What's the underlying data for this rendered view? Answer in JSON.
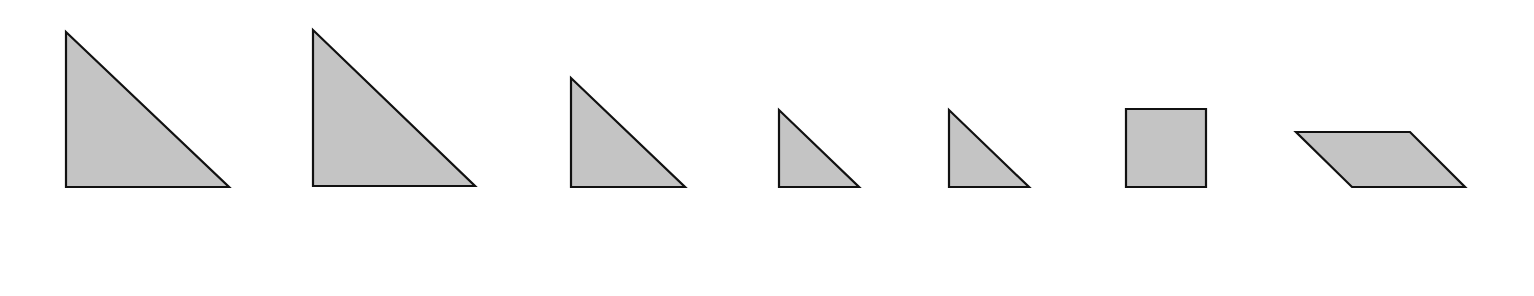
{
  "diagram": {
    "fill_color": "#c4c4c4",
    "stroke_color": "#111111",
    "stroke_width": 2.2,
    "shapes": [
      {
        "name": "large-triangle-1",
        "type": "triangle",
        "points": "66,32 66,187 229,187"
      },
      {
        "name": "large-triangle-2",
        "type": "triangle",
        "points": "313,30 313,186 475,186"
      },
      {
        "name": "medium-triangle",
        "type": "triangle",
        "points": "571,78 571,187 685,187"
      },
      {
        "name": "small-triangle-1",
        "type": "triangle",
        "points": "779,110 779,187 859,187"
      },
      {
        "name": "small-triangle-2",
        "type": "triangle",
        "points": "949,110 949,187 1029,187"
      },
      {
        "name": "square",
        "type": "square",
        "points": "1126,109 1206,109 1206,187 1126,187"
      },
      {
        "name": "parallelogram",
        "type": "parallelogram",
        "points": "1296,132 1410,132 1465,187 1352,187"
      }
    ]
  }
}
